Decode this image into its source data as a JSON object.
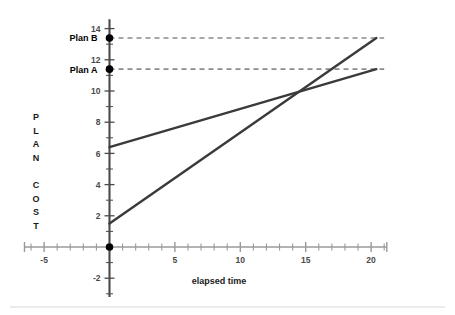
{
  "chart_data": {
    "type": "line",
    "title": "",
    "xlabel": "elapsed time",
    "ylabel": "PLAN COST",
    "ylabel_chars": [
      "P",
      "L",
      "A",
      "N",
      "",
      "C",
      "O",
      "S",
      "T"
    ],
    "xlim": [
      -6.5,
      21.2
    ],
    "ylim": [
      -3.2,
      14.6
    ],
    "x_ticks_major": [
      -5,
      5,
      10,
      15,
      20
    ],
    "x_tick_labels": [
      "-5",
      "5",
      "10",
      "15",
      "20"
    ],
    "x_tick_step_minor": 1,
    "y_ticks_major": [
      -2,
      2,
      4,
      6,
      8,
      10,
      12,
      14
    ],
    "y_tick_labels": [
      "-2",
      "2",
      "4",
      "6",
      "8",
      "10",
      "12",
      "14"
    ],
    "y_tick_step_minor": 1,
    "grid": false,
    "legend_position": "inline-left",
    "series": [
      {
        "name": "Plan A",
        "intercept": 6.4,
        "slope": 0.2451,
        "x_start": 0,
        "x_end": 20.4,
        "y_start": 6.4,
        "y_end": 11.4,
        "color": "#3a3a3a",
        "style": "solid"
      },
      {
        "name": "Plan B",
        "intercept": 1.5,
        "slope": 0.5833,
        "x_start": 0,
        "x_end": 20.4,
        "y_start": 1.5,
        "y_end": 13.4,
        "color": "#3a3a3a",
        "style": "solid"
      }
    ],
    "markers": [
      {
        "label": "Plan B",
        "x": 0,
        "y": 13.4,
        "color": "#000000"
      },
      {
        "label": "Plan A",
        "x": 0,
        "y": 11.4,
        "color": "#000000"
      },
      {
        "label": "",
        "x": 0,
        "y": 0,
        "color": "#000000"
      }
    ],
    "annotations": [
      {
        "name": "plan-b-guide",
        "type": "dashed-horizontal",
        "y": 13.4,
        "x_start": 0,
        "x_end": 21.0,
        "color": "#8c8c8c"
      },
      {
        "name": "plan-a-guide",
        "type": "dashed-horizontal",
        "y": 11.4,
        "x_start": 0,
        "x_end": 21.0,
        "color": "#8c8c8c"
      }
    ],
    "intersection": {
      "x": 14.8,
      "y": 10.0
    },
    "axis_colors": {
      "x_axis": "#9a9a9a",
      "y_axis": "#4a4a4a"
    },
    "footer_rule_color": "#d8d8d8"
  },
  "labels": {
    "plan_a": "Plan A",
    "plan_b": "Plan B"
  }
}
